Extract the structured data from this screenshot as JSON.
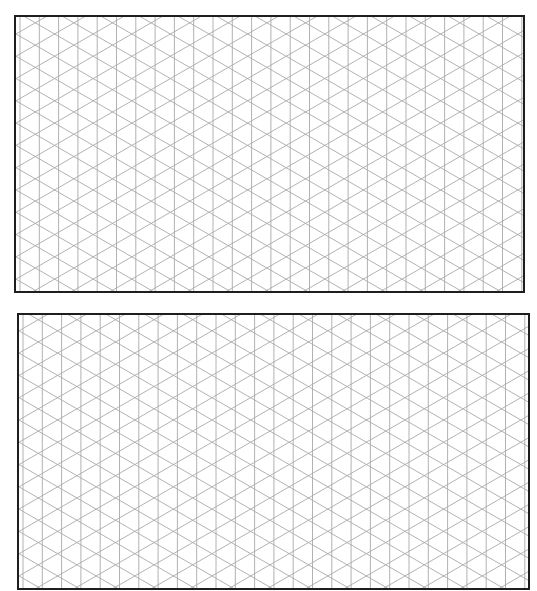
{
  "page": {
    "type": "isometric-grid-paper",
    "background_color": "#ffffff"
  },
  "grid_style": {
    "line_color": "#a9a9a9",
    "border_color": "#1e1e1e",
    "vertical_spacing_px": 19.3,
    "diagonal_angle_deg": 30
  },
  "frames": [
    {
      "name": "grid-frame-top",
      "x": 14,
      "y": 15,
      "width": 511,
      "height": 278
    },
    {
      "name": "grid-frame-bottom",
      "x": 17,
      "y": 313,
      "width": 513,
      "height": 277
    }
  ]
}
